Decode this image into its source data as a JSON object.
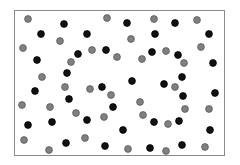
{
  "figure": {
    "frame": {
      "x": 14,
      "y": 10,
      "width": 211,
      "height": 146,
      "border_color": "#8a8a8a"
    },
    "dot_radius": 3.4,
    "colors": {
      "gray": {
        "fill": "#808080",
        "stroke": "#5a5a5a"
      },
      "black": {
        "fill": "#111111",
        "stroke": "#000000"
      }
    }
  },
  "dots": [
    {
      "x": 28,
      "y": 19,
      "c": "gray"
    },
    {
      "x": 64,
      "y": 24,
      "c": "black"
    },
    {
      "x": 107,
      "y": 18,
      "c": "gray"
    },
    {
      "x": 127,
      "y": 23,
      "c": "black"
    },
    {
      "x": 154,
      "y": 19,
      "c": "gray"
    },
    {
      "x": 175,
      "y": 23,
      "c": "black"
    },
    {
      "x": 197,
      "y": 20,
      "c": "gray"
    },
    {
      "x": 41,
      "y": 34,
      "c": "black"
    },
    {
      "x": 87,
      "y": 34,
      "c": "black"
    },
    {
      "x": 155,
      "y": 34,
      "c": "black"
    },
    {
      "x": 209,
      "y": 34,
      "c": "black"
    },
    {
      "x": 60,
      "y": 41,
      "c": "gray"
    },
    {
      "x": 131,
      "y": 39,
      "c": "gray"
    },
    {
      "x": 23,
      "y": 48,
      "c": "gray"
    },
    {
      "x": 201,
      "y": 47,
      "c": "gray"
    },
    {
      "x": 78,
      "y": 54,
      "c": "black"
    },
    {
      "x": 92,
      "y": 50,
      "c": "gray"
    },
    {
      "x": 106,
      "y": 50,
      "c": "black"
    },
    {
      "x": 152,
      "y": 52,
      "c": "black"
    },
    {
      "x": 166,
      "y": 51,
      "c": "gray"
    },
    {
      "x": 178,
      "y": 55,
      "c": "black"
    },
    {
      "x": 117,
      "y": 57,
      "c": "gray"
    },
    {
      "x": 142,
      "y": 59,
      "c": "gray"
    },
    {
      "x": 37,
      "y": 60,
      "c": "black"
    },
    {
      "x": 71,
      "y": 62,
      "c": "gray"
    },
    {
      "x": 184,
      "y": 63,
      "c": "gray"
    },
    {
      "x": 213,
      "y": 63,
      "c": "black"
    },
    {
      "x": 67,
      "y": 73,
      "c": "black"
    },
    {
      "x": 42,
      "y": 77,
      "c": "gray"
    },
    {
      "x": 182,
      "y": 77,
      "c": "black"
    },
    {
      "x": 132,
      "y": 81,
      "c": "black"
    },
    {
      "x": 164,
      "y": 84,
      "c": "black"
    },
    {
      "x": 65,
      "y": 87,
      "c": "gray"
    },
    {
      "x": 90,
      "y": 89,
      "c": "gray"
    },
    {
      "x": 102,
      "y": 87,
      "c": "black"
    },
    {
      "x": 175,
      "y": 87,
      "c": "gray"
    },
    {
      "x": 35,
      "y": 91,
      "c": "black"
    },
    {
      "x": 111,
      "y": 95,
      "c": "gray"
    },
    {
      "x": 183,
      "y": 96,
      "c": "black"
    },
    {
      "x": 215,
      "y": 93,
      "c": "black"
    },
    {
      "x": 69,
      "y": 99,
      "c": "black"
    },
    {
      "x": 140,
      "y": 102,
      "c": "gray"
    },
    {
      "x": 22,
      "y": 105,
      "c": "gray"
    },
    {
      "x": 50,
      "y": 107,
      "c": "gray"
    },
    {
      "x": 113,
      "y": 107,
      "c": "black"
    },
    {
      "x": 185,
      "y": 109,
      "c": "gray"
    },
    {
      "x": 209,
      "y": 109,
      "c": "gray"
    },
    {
      "x": 76,
      "y": 113,
      "c": "gray"
    },
    {
      "x": 143,
      "y": 115,
      "c": "gray"
    },
    {
      "x": 104,
      "y": 117,
      "c": "gray"
    },
    {
      "x": 87,
      "y": 120,
      "c": "black"
    },
    {
      "x": 52,
      "y": 122,
      "c": "black"
    },
    {
      "x": 154,
      "y": 122,
      "c": "black"
    },
    {
      "x": 179,
      "y": 121,
      "c": "black"
    },
    {
      "x": 168,
      "y": 124,
      "c": "gray"
    },
    {
      "x": 28,
      "y": 125,
      "c": "black"
    },
    {
      "x": 123,
      "y": 130,
      "c": "black"
    },
    {
      "x": 210,
      "y": 130,
      "c": "black"
    },
    {
      "x": 85,
      "y": 138,
      "c": "gray"
    },
    {
      "x": 24,
      "y": 140,
      "c": "gray"
    },
    {
      "x": 66,
      "y": 143,
      "c": "black"
    },
    {
      "x": 105,
      "y": 146,
      "c": "black"
    },
    {
      "x": 182,
      "y": 145,
      "c": "black"
    },
    {
      "x": 205,
      "y": 147,
      "c": "gray"
    },
    {
      "x": 150,
      "y": 148,
      "c": "black"
    },
    {
      "x": 128,
      "y": 149,
      "c": "gray"
    },
    {
      "x": 49,
      "y": 150,
      "c": "gray"
    },
    {
      "x": 166,
      "y": 151,
      "c": "gray"
    }
  ]
}
